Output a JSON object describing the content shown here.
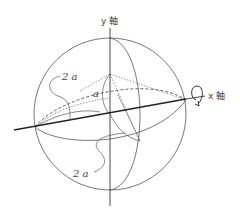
{
  "figure": {
    "type": "sphere-rotation-diagram",
    "labels": {
      "y_axis": "y 軸",
      "x_axis": "x 軸",
      "upper_length": "2 a",
      "lower_length": "2 a",
      "angle_or_radius": "a"
    },
    "elements": [
      "sphere-outline",
      "x-axis (thick, with rotation arrow)",
      "y-axis (vertical)",
      "equator-ellipse",
      "meridian-ellipse",
      "dotted-cone-from-apex",
      "dashed-back-arcs",
      "rotation-arrow-around-x-axis"
    ],
    "colors": {
      "line": "#555555",
      "axis": "#222222",
      "background": "#ffffff"
    }
  }
}
